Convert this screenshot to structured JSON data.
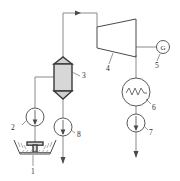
{
  "diagram": {
    "type": "process-flow-diagram",
    "canvas": {
      "width": 180,
      "height": 181,
      "background": "#ffffff"
    },
    "colors": {
      "pipe": "#8a8a8a",
      "outline": "#4a4a4a",
      "vessel_fill": "#d7d7d7",
      "label_text": "#2b2b2b",
      "leader": "#6b6b6b"
    },
    "components": [
      {
        "id": "1",
        "label": "1",
        "name": "basin-spray-pond",
        "symbol": "hatched-basin-with-spray-nozzle",
        "label_x": 33,
        "label_y": 172
      },
      {
        "id": "2",
        "label": "2",
        "name": "pump-2",
        "symbol": "circle-with-arrow",
        "arrow_direction": "down",
        "label_x": 12,
        "label_y": 127
      },
      {
        "id": "3",
        "label": "3",
        "name": "flash-separator-vessel",
        "symbol": "vertical-vessel-conical-caps",
        "label_x": 82,
        "label_y": 78
      },
      {
        "id": "4",
        "label": "4",
        "name": "steam-turbine",
        "symbol": "trapezoid-turbine",
        "label_x": 106,
        "label_y": 70
      },
      {
        "id": "5",
        "label": "5",
        "name": "generator",
        "symbol": "circle-with-letter",
        "glyph": "G",
        "label_x": 158,
        "label_y": 61
      },
      {
        "id": "6",
        "label": "6",
        "name": "condenser-heat-exchanger",
        "symbol": "circle-with-coil",
        "label_x": 155,
        "label_y": 105
      },
      {
        "id": "7",
        "label": "7",
        "name": "pump-7",
        "symbol": "circle-with-arrow",
        "arrow_direction": "down",
        "label_x": 150,
        "label_y": 131
      },
      {
        "id": "8",
        "label": "8",
        "name": "pump-8",
        "symbol": "circle-with-arrow",
        "arrow_direction": "down",
        "label_x": 78,
        "label_y": 131
      }
    ],
    "flow_arrows": [
      {
        "name": "steam-line-arrow-top",
        "x": 78,
        "y": 13,
        "direction": "right"
      },
      {
        "name": "outlet-arrow-left-bottom",
        "x": 63,
        "y": 161,
        "direction": "down"
      },
      {
        "name": "outlet-arrow-right-bottom",
        "x": 136,
        "y": 155,
        "direction": "down"
      }
    ]
  }
}
